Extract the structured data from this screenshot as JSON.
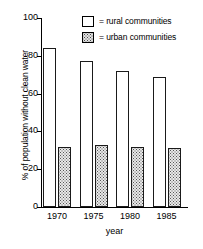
{
  "chart_data": {
    "type": "bar",
    "title": "",
    "subtitle": "",
    "xlabel": "year",
    "ylabel": "% of population without clean water",
    "categories": [
      "1970",
      "1975",
      "1980",
      "1985"
    ],
    "series": [
      {
        "name": "rural communities",
        "values": [
          84,
          77,
          72,
          69
        ],
        "fill": "white",
        "legend_prefix": "="
      },
      {
        "name": "urban communities",
        "values": [
          31.5,
          33,
          32,
          31
        ],
        "fill": "stippled",
        "legend_prefix": "="
      }
    ],
    "ylim": [
      0,
      100
    ],
    "yticks": [
      0,
      20,
      40,
      60,
      80,
      100
    ],
    "ytick_labels": [
      "0",
      "20",
      "40",
      "60",
      "80",
      "100"
    ],
    "grid": false,
    "legend_position": "top-right",
    "legend_entries": [
      {
        "label": "= rural communities",
        "swatch": "white-square"
      },
      {
        "label": "= urban communities",
        "swatch": "stippled-square"
      }
    ],
    "colors": {
      "axis": "#000000",
      "bar_outline": "#1a1a1a",
      "rural_fill": "#ffffff",
      "urban_fill": "#e8e8e8",
      "urban_dots": "#565656",
      "background": "#ffffff"
    }
  }
}
